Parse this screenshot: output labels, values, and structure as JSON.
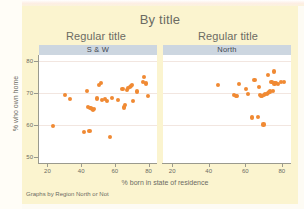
{
  "chart_data": {
    "type": "scatter",
    "title": "By title",
    "note": "Graphs by Region North or Not",
    "xlabel": "% born in state of residence",
    "ylabel": "% who own home",
    "xlim": [
      15,
      85
    ],
    "ylim": [
      48,
      82
    ],
    "xticks": [
      20,
      40,
      60,
      80
    ],
    "yticks": [
      50,
      60,
      70,
      80
    ],
    "grid": true,
    "gridlines_y": [
      60,
      70,
      80
    ],
    "legend": "none",
    "marker_color": "#f08a33",
    "panel_header_color": "#ccd6e0",
    "background_color": "#fbf4cf",
    "panels": [
      {
        "panel_title": "Regular title",
        "panel_label": "S & W",
        "points": [
          {
            "x": 23.5,
            "y": 59.6
          },
          {
            "x": 30.5,
            "y": 69.5
          },
          {
            "x": 33.5,
            "y": 68.2
          },
          {
            "x": 41.5,
            "y": 57.8
          },
          {
            "x": 43.5,
            "y": 70.7
          },
          {
            "x": 44.2,
            "y": 65.6
          },
          {
            "x": 45.0,
            "y": 58.2
          },
          {
            "x": 45.5,
            "y": 65.3
          },
          {
            "x": 46.3,
            "y": 65.0
          },
          {
            "x": 47.0,
            "y": 64.8
          },
          {
            "x": 47.8,
            "y": 64.9
          },
          {
            "x": 49.5,
            "y": 68.3
          },
          {
            "x": 50.8,
            "y": 72.6
          },
          {
            "x": 51.6,
            "y": 73.3
          },
          {
            "x": 52.5,
            "y": 67.9
          },
          {
            "x": 54.0,
            "y": 68.2
          },
          {
            "x": 55.5,
            "y": 67.6
          },
          {
            "x": 57.0,
            "y": 56.2
          },
          {
            "x": 58.5,
            "y": 68.5
          },
          {
            "x": 62.0,
            "y": 67.8
          },
          {
            "x": 64.5,
            "y": 71.2
          },
          {
            "x": 65.5,
            "y": 65.5
          },
          {
            "x": 66.0,
            "y": 66.2
          },
          {
            "x": 67.0,
            "y": 71.0
          },
          {
            "x": 68.0,
            "y": 71.6
          },
          {
            "x": 68.8,
            "y": 72.0
          },
          {
            "x": 69.5,
            "y": 72.3
          },
          {
            "x": 70.2,
            "y": 72.6
          },
          {
            "x": 71.0,
            "y": 67.4
          },
          {
            "x": 73.0,
            "y": 70.5
          },
          {
            "x": 76.5,
            "y": 73.5
          },
          {
            "x": 77.5,
            "y": 75.0
          },
          {
            "x": 78.5,
            "y": 73.0
          },
          {
            "x": 79.5,
            "y": 69.2
          }
        ]
      },
      {
        "panel_title": "Regular title",
        "panel_label": "North",
        "points": [
          {
            "x": 45.0,
            "y": 72.5
          },
          {
            "x": 54.0,
            "y": 69.4
          },
          {
            "x": 54.8,
            "y": 69.2
          },
          {
            "x": 55.5,
            "y": 69.0
          },
          {
            "x": 56.5,
            "y": 72.8
          },
          {
            "x": 60.5,
            "y": 71.4
          },
          {
            "x": 61.5,
            "y": 69.6
          },
          {
            "x": 63.5,
            "y": 62.3
          },
          {
            "x": 65.0,
            "y": 74.2
          },
          {
            "x": 67.0,
            "y": 62.6
          },
          {
            "x": 67.5,
            "y": 71.8
          },
          {
            "x": 68.0,
            "y": 69.3
          },
          {
            "x": 68.5,
            "y": 69.1
          },
          {
            "x": 69.2,
            "y": 69.2
          },
          {
            "x": 70.0,
            "y": 60.1
          },
          {
            "x": 70.3,
            "y": 69.4
          },
          {
            "x": 71.0,
            "y": 69.6
          },
          {
            "x": 71.7,
            "y": 69.8
          },
          {
            "x": 72.3,
            "y": 70.0
          },
          {
            "x": 72.5,
            "y": 75.6
          },
          {
            "x": 73.0,
            "y": 70.3
          },
          {
            "x": 73.6,
            "y": 70.5
          },
          {
            "x": 74.3,
            "y": 73.4
          },
          {
            "x": 75.0,
            "y": 70.7
          },
          {
            "x": 75.5,
            "y": 76.8
          },
          {
            "x": 76.0,
            "y": 73.0
          },
          {
            "x": 77.0,
            "y": 73.2
          },
          {
            "x": 78.0,
            "y": 72.8
          },
          {
            "x": 79.5,
            "y": 73.6
          },
          {
            "x": 81.0,
            "y": 73.4
          }
        ]
      }
    ]
  }
}
